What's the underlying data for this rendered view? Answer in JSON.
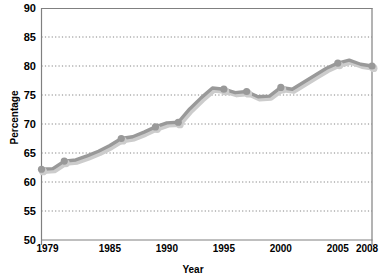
{
  "chart_data": {
    "type": "line",
    "title": "",
    "xlabel": "Year",
    "ylabel": "Percentage",
    "xlim": [
      1979,
      2008
    ],
    "ylim": [
      50,
      90
    ],
    "ytick_values": [
      90,
      85,
      80,
      75,
      70,
      65,
      60,
      55,
      50
    ],
    "xtick_values": [
      1979,
      1985,
      1990,
      1995,
      2000,
      2005,
      2008
    ],
    "ytick_labels": [
      "90",
      "85",
      "80",
      "75",
      "70",
      "65",
      "60",
      "55",
      "50"
    ],
    "xtick_labels": [
      "1979",
      "1985",
      "1990",
      "1995",
      "2000",
      "2005",
      "2008"
    ],
    "grid": "horizontal-dotted",
    "legend": "none",
    "series": [
      {
        "name": "Percentage",
        "color": "#999999",
        "marker": "circle",
        "x": [
          1979,
          1980,
          1981,
          1982,
          1983,
          1984,
          1985,
          1986,
          1987,
          1988,
          1989,
          1990,
          1991,
          1992,
          1993,
          1994,
          1995,
          1996,
          1997,
          1998,
          1999,
          2000,
          2001,
          2002,
          2003,
          2004,
          2005,
          2006,
          2007,
          2008
        ],
        "values": [
          62.2,
          62.3,
          63.6,
          63.8,
          64.5,
          65.3,
          66.3,
          67.5,
          67.8,
          68.6,
          69.5,
          70.2,
          70.3,
          72.6,
          74.5,
          76.2,
          76.0,
          75.4,
          75.6,
          74.7,
          74.8,
          76.3,
          76.0,
          77.2,
          78.4,
          79.6,
          80.5,
          81.0,
          80.3,
          80.0
        ]
      }
    ],
    "marker_points": [
      {
        "x": 1979,
        "y": 62.2
      },
      {
        "x": 1981,
        "y": 63.6
      },
      {
        "x": 1986,
        "y": 67.5
      },
      {
        "x": 1989,
        "y": 69.5
      },
      {
        "x": 1991,
        "y": 70.3
      },
      {
        "x": 1995,
        "y": 76.0
      },
      {
        "x": 1997,
        "y": 75.6
      },
      {
        "x": 2000,
        "y": 76.3
      },
      {
        "x": 2005,
        "y": 80.5
      },
      {
        "x": 2008,
        "y": 80.0
      }
    ]
  },
  "style": {
    "line_color": "#999999",
    "shadow_color": "#cccccc",
    "axis_color": "#808080",
    "grid_color": "#777777",
    "text_color": "#000000",
    "background": "#ffffff"
  }
}
